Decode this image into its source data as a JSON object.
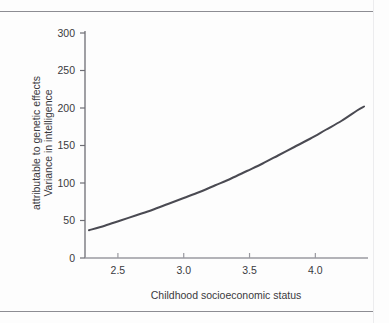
{
  "figure": {
    "background_color": "#fdfdfd",
    "rule_color": "#8d8d93"
  },
  "chart_data": {
    "type": "line",
    "title": "",
    "subtitle": "",
    "xlabel": "Childhood socioeconomic status",
    "ylabel": "Variance in intelligence attributable to genetic effects",
    "ylabel_line1": "Variance in intelligence",
    "ylabel_line2": "attributable to genetic effects",
    "xlim": [
      2.25,
      4.4
    ],
    "ylim": [
      0,
      300
    ],
    "xticks": [
      2.5,
      3.0,
      3.5,
      4.0
    ],
    "xtick_labels": [
      "2.5",
      "3.0",
      "3.5",
      "4.0"
    ],
    "yticks": [
      0,
      50,
      100,
      150,
      200,
      250,
      300
    ],
    "ytick_labels": [
      "0",
      "50",
      "100",
      "150",
      "200",
      "250",
      "300"
    ],
    "grid": false,
    "legend": null,
    "series": [
      {
        "name": "Variance attributable to genetic effects",
        "color": "#4a4a52",
        "line_width": 2,
        "x": [
          2.28,
          2.4,
          2.52,
          2.64,
          2.76,
          2.88,
          3.0,
          3.12,
          3.24,
          3.36,
          3.48,
          3.6,
          3.72,
          3.84,
          3.96,
          4.08,
          4.2,
          4.32,
          4.37
        ],
        "y": [
          37,
          43,
          50,
          57,
          64,
          72,
          80,
          88,
          97,
          106,
          116,
          126,
          137,
          148,
          159,
          171,
          183,
          197,
          202
        ]
      }
    ],
    "annotations": []
  }
}
